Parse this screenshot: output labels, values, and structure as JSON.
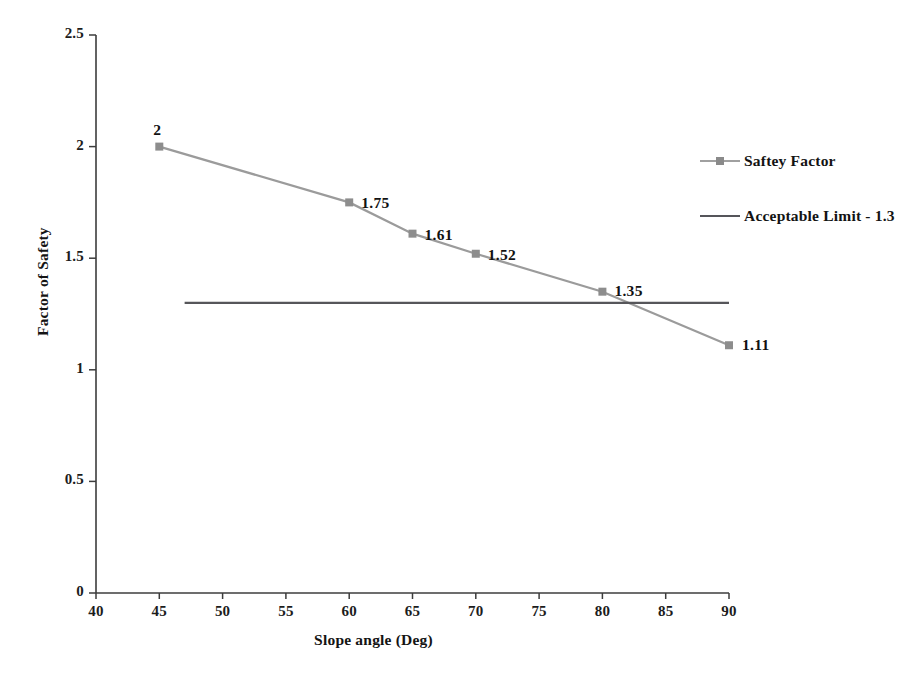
{
  "chart_data": {
    "type": "line",
    "title": "",
    "xlabel": "Slope angle (Deg)",
    "ylabel": "Factor of Safety",
    "xlim": [
      40,
      90
    ],
    "ylim": [
      0,
      2.5
    ],
    "xticks": [
      "40",
      "45",
      "50",
      "55",
      "60",
      "65",
      "70",
      "75",
      "80",
      "85",
      "90"
    ],
    "yticks": [
      "0",
      "0.5",
      "1",
      "1.5",
      "2",
      "2.5"
    ],
    "grid": false,
    "legend_position": "right",
    "series": [
      {
        "name": "Saftey Factor",
        "type": "line",
        "color": "#9b9b9b",
        "marker": "square",
        "x": [
          45,
          60,
          65,
          70,
          80,
          90
        ],
        "values": [
          2,
          1.75,
          1.61,
          1.52,
          1.35,
          1.11
        ],
        "labels": [
          "2",
          "1.75",
          "1.61",
          "1.52",
          "1.35",
          "1.11"
        ]
      },
      {
        "name": "Acceptable Limit - 1.3",
        "type": "hline",
        "color": "#56565a",
        "marker": "none",
        "x": [
          47,
          90
        ],
        "values": [
          1.3,
          1.3
        ],
        "labels": []
      }
    ]
  },
  "axes": {
    "y_title": "Factor of Safety",
    "x_title": "Slope angle (Deg)",
    "y_ticks": [
      {
        "label": "2.5",
        "value": 2.5
      },
      {
        "label": "2",
        "value": 2
      },
      {
        "label": "1.5",
        "value": 1.5
      },
      {
        "label": "1",
        "value": 1
      },
      {
        "label": "0.5",
        "value": 0.5
      },
      {
        "label": "0",
        "value": 0
      }
    ],
    "x_ticks": [
      {
        "label": "40",
        "value": 40
      },
      {
        "label": "45",
        "value": 45
      },
      {
        "label": "50",
        "value": 50
      },
      {
        "label": "55",
        "value": 55
      },
      {
        "label": "60",
        "value": 60
      },
      {
        "label": "65",
        "value": 65
      },
      {
        "label": "70",
        "value": 70
      },
      {
        "label": "75",
        "value": 75
      },
      {
        "label": "80",
        "value": 80
      },
      {
        "label": "85",
        "value": 85
      },
      {
        "label": "90",
        "value": 90
      }
    ],
    "axis_color": "#3c3c3c"
  },
  "legend": {
    "items": [
      {
        "label": "Saftey Factor",
        "color": "#a0a0a0",
        "marker": "square",
        "marker_color": "#8a8a8a"
      },
      {
        "label": "Acceptable Limit - 1.3",
        "color": "#55555a",
        "marker": "none",
        "marker_color": "#55555a"
      }
    ]
  },
  "point_labels": [
    {
      "text": "2",
      "x": 45,
      "y": 2
    },
    {
      "text": "1.75",
      "x": 60,
      "y": 1.75
    },
    {
      "text": "1.61",
      "x": 65,
      "y": 1.61
    },
    {
      "text": "1.52",
      "x": 70,
      "y": 1.52
    },
    {
      "text": "1.35",
      "x": 80,
      "y": 1.35
    },
    {
      "text": "1.11",
      "x": 90,
      "y": 1.11
    }
  ],
  "colors": {
    "series_line": "#9b9b9b",
    "limit_line": "#56565a",
    "marker": "#8d8d8d",
    "axis": "#3c3c3c",
    "text": "#141414",
    "background": "#ffffff"
  }
}
